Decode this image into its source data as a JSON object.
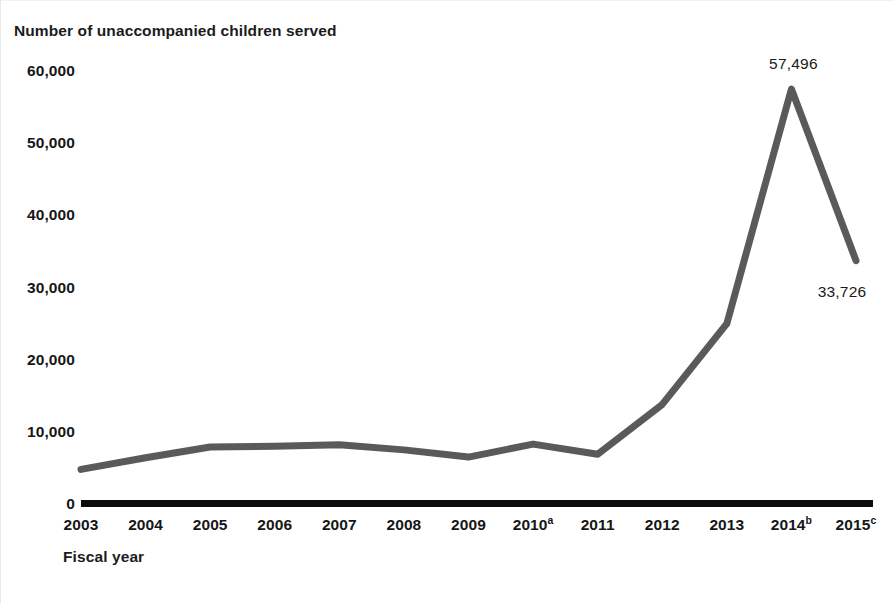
{
  "chart_data": {
    "type": "line",
    "title": "Number of unaccompanied children served",
    "xlabel": "Fiscal year",
    "ylabel": "",
    "ylim": [
      0,
      60000
    ],
    "xlim_categories": [
      "2003",
      "2004",
      "2005",
      "2006",
      "2007",
      "2008",
      "2009",
      "2010",
      "2011",
      "2012",
      "2013",
      "2014",
      "2015"
    ],
    "categories": [
      "2003",
      "2004",
      "2005",
      "2006",
      "2007",
      "2008",
      "2009",
      "2010",
      "2011",
      "2012",
      "2013",
      "2014",
      "2015"
    ],
    "category_labels": [
      {
        "text": "2003",
        "superscript": ""
      },
      {
        "text": "2004",
        "superscript": ""
      },
      {
        "text": "2005",
        "superscript": ""
      },
      {
        "text": "2006",
        "superscript": ""
      },
      {
        "text": "2007",
        "superscript": ""
      },
      {
        "text": "2008",
        "superscript": ""
      },
      {
        "text": "2009",
        "superscript": ""
      },
      {
        "text": "2010",
        "superscript": "a"
      },
      {
        "text": "2011",
        "superscript": ""
      },
      {
        "text": "2012",
        "superscript": ""
      },
      {
        "text": "2013",
        "superscript": ""
      },
      {
        "text": "2014",
        "superscript": "b"
      },
      {
        "text": "2015",
        "superscript": "c"
      }
    ],
    "values": [
      4800,
      6400,
      7900,
      8000,
      8200,
      7500,
      6500,
      8300,
      6900,
      13800,
      25000,
      57496,
      33726
    ],
    "y_ticks": [
      0,
      10000,
      20000,
      30000,
      40000,
      50000,
      60000
    ],
    "y_tick_labels": [
      "0",
      "10,000",
      "20,000",
      "30,000",
      "40,000",
      "50,000",
      "60,000"
    ],
    "grid": false,
    "legend": "none",
    "data_labels": [
      {
        "category": "2014",
        "value": 57496,
        "text": "57,496"
      },
      {
        "category": "2015",
        "value": 33726,
        "text": "33,726"
      }
    ],
    "line_color": "#5a5a5a",
    "axis_color": "#0c0c0c",
    "text_color": "#161616",
    "background_color": "#ffffff"
  }
}
